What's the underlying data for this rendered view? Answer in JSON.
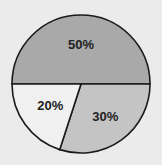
{
  "chart_data": {
    "type": "pie",
    "title": "",
    "labels": [
      "50%",
      "30%",
      "20%"
    ],
    "values": [
      50,
      30,
      20
    ],
    "colors": [
      "#a9a9a9",
      "#c4c4c4",
      "#f0f0f0"
    ],
    "start_angle_deg": 180,
    "direction": "clockwise",
    "legend": "none"
  }
}
